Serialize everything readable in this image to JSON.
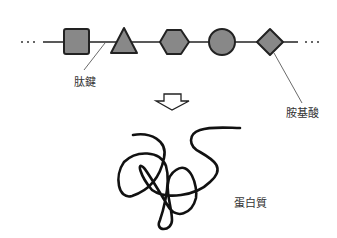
{
  "diagram": {
    "chain_shapes": [
      "square",
      "triangle",
      "hexagon",
      "circle",
      "diamond"
    ],
    "shape_fill": "#888888",
    "line_color": "#222222",
    "labels": {
      "peptide_bond": "肽鍵",
      "amino_acid": "胺基酸",
      "protein": "蛋白質"
    },
    "ellipsis_left": "···",
    "ellipsis_right": "···"
  }
}
